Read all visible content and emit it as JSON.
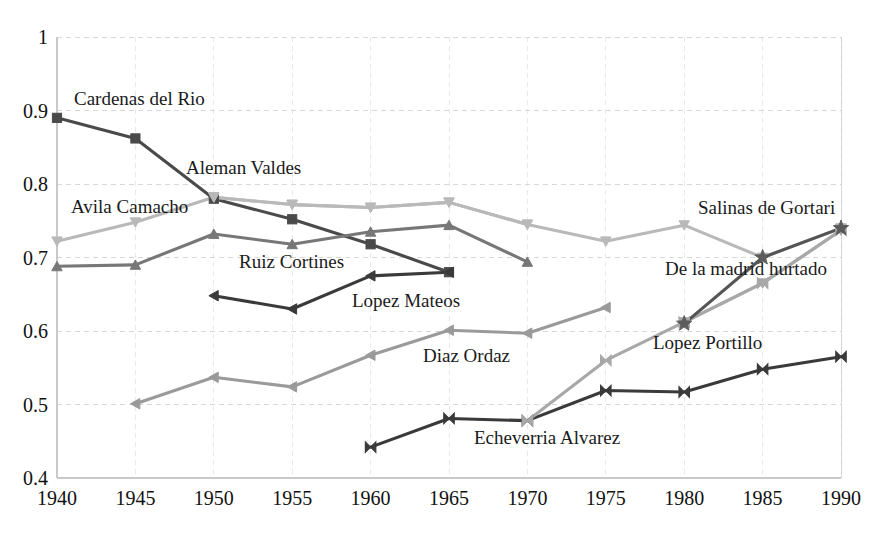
{
  "chart_data": {
    "type": "line",
    "title": "",
    "xlabel": "",
    "ylabel": "",
    "xlim": [
      1940,
      1990
    ],
    "ylim": [
      0.4,
      1.0
    ],
    "grid": true,
    "legend_position": "inline-annotations",
    "x": [
      1940,
      1945,
      1950,
      1955,
      1960,
      1965,
      1970,
      1975,
      1980,
      1985,
      1990
    ],
    "xticks": [
      "1940",
      "1945",
      "1950",
      "1955",
      "1960",
      "1965",
      "1970",
      "1975",
      "1980",
      "1985",
      "1990"
    ],
    "yticks": [
      "1",
      "0.9",
      "0.8",
      "0.7",
      "0.6",
      "0.5",
      "0.4"
    ],
    "ytick_values": [
      1,
      0.9,
      0.8,
      0.7,
      0.6,
      0.5,
      0.4
    ],
    "series": [
      {
        "name": "Cardenas del Rio",
        "color": "#4a4a4a",
        "marker": "square",
        "x": [
          1940,
          1945,
          1950,
          1955,
          1960,
          1965
        ],
        "values": [
          0.89,
          0.862,
          0.78,
          0.752,
          0.718,
          0.68
        ],
        "label_x": 74,
        "label_y": 88
      },
      {
        "name": "Avila Camacho",
        "color": "#b9b9b9",
        "marker": "triangle-down",
        "x": [
          1940,
          1945,
          1950,
          1955,
          1960,
          1965,
          1970
        ],
        "values": [
          0.722,
          0.748,
          0.782,
          0.772,
          0.768,
          0.775,
          0.745
        ],
        "label_x": 71,
        "label_y": 196
      },
      {
        "name": "Aleman Valdes",
        "color": "#b9b9b9",
        "marker": "triangle-down",
        "x": [
          1950,
          1955,
          1960,
          1965,
          1970,
          1975,
          1980,
          1985,
          1990
        ],
        "values": [
          0.782,
          0.772,
          0.768,
          0.775,
          0.745,
          0.722,
          0.744,
          0.7,
          0.74
        ],
        "label_x": 186,
        "label_y": 157
      },
      {
        "name": "Ruiz Cortines",
        "color": "#777777",
        "marker": "triangle-up",
        "x": [
          1940,
          1945,
          1950,
          1955,
          1960,
          1965,
          1970
        ],
        "values": [
          0.688,
          0.69,
          0.732,
          0.718,
          0.735,
          0.744,
          0.694
        ],
        "label_x": 239,
        "label_y": 251
      },
      {
        "name": "Lopez Mateos",
        "color": "#3a3a3a",
        "marker": "triangle-left",
        "x": [
          1950,
          1955,
          1960,
          1965
        ],
        "values": [
          0.648,
          0.63,
          0.675,
          0.68
        ],
        "label_x": 352,
        "label_y": 290
      },
      {
        "name": "Diaz Ordaz",
        "color": "#9a9a9a",
        "marker": "triangle-left",
        "x": [
          1945,
          1950,
          1955,
          1960,
          1965,
          1970,
          1975
        ],
        "values": [
          0.501,
          0.537,
          0.524,
          0.567,
          0.601,
          0.597,
          0.632
        ],
        "label_x": 423,
        "label_y": 345
      },
      {
        "name": "Echeverria Alvarez",
        "color": "#3a3a3a",
        "marker": "bowtie",
        "x": [
          1960,
          1965,
          1970,
          1975,
          1980,
          1985,
          1990
        ],
        "values": [
          0.442,
          0.481,
          0.478,
          0.519,
          0.517,
          0.548,
          0.565
        ],
        "label_x": 474,
        "label_y": 427
      },
      {
        "name": "Lopez Portillo",
        "color": "#a8a8a8",
        "marker": "bowtie",
        "x": [
          1970,
          1975,
          1980,
          1985,
          1990
        ],
        "values": [
          0.478,
          0.56,
          0.612,
          0.665,
          0.737
        ],
        "label_x": 653,
        "label_y": 332
      },
      {
        "name": "De la madrid hurtado",
        "color": "#a8a8a8",
        "marker": "triangle-down",
        "x": [
          1980,
          1985,
          1990
        ],
        "values": [
          0.612,
          0.665,
          0.737
        ],
        "label_x": 665,
        "label_y": 258
      },
      {
        "name": "Salinas de Gortari",
        "color": "#555555",
        "marker": "star",
        "x": [
          1980,
          1985,
          1990
        ],
        "values": [
          0.61,
          0.7,
          0.74
        ],
        "label_x": 698,
        "label_y": 197
      }
    ],
    "annotations": [
      "Cardenas del Rio",
      "Avila Camacho",
      "Aleman Valdes",
      "Ruiz Cortines",
      "Lopez Mateos",
      "Diaz Ordaz",
      "Echeverria Alvarez",
      "Lopez Portillo",
      "De la madrid hurtado",
      "Salinas de Gortari"
    ]
  },
  "axes": {
    "plot_left": 57,
    "plot_right": 841,
    "plot_top": 37,
    "plot_bottom": 478,
    "grid_color": "#d8d8d8",
    "axis_color": "#c9c9c9"
  }
}
